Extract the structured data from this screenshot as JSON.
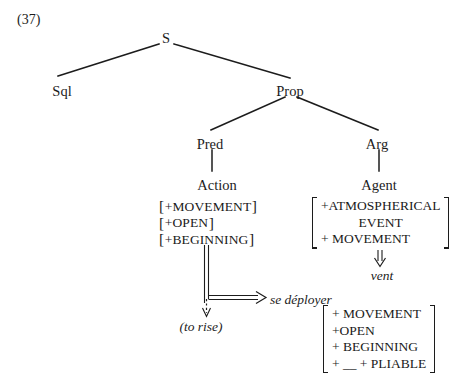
{
  "figure": {
    "example_number": "(37)",
    "background_color": "#ffffff",
    "ink_color": "#1c1c1c"
  },
  "tree": {
    "nodes": [
      {
        "id": "s",
        "label": "S"
      },
      {
        "id": "sql",
        "label": "Sql"
      },
      {
        "id": "prop",
        "label": "Prop"
      },
      {
        "id": "pred",
        "label": "Pred"
      },
      {
        "id": "arg",
        "label": "Arg"
      },
      {
        "id": "action",
        "label": "Action"
      },
      {
        "id": "agent",
        "label": "Agent"
      }
    ]
  },
  "matrices": {
    "action_features": {
      "bracket_style": "per-line",
      "open_bracket": "[",
      "close_bracket": "]",
      "rows": [
        {
          "text": "+MOVEMENT"
        },
        {
          "text": "+OPEN"
        },
        {
          "text": "+BEGINNING"
        }
      ]
    },
    "agent_features": {
      "bracket_style": "single-tall",
      "rows": [
        {
          "text": "+ATMOSPHERICAL",
          "align": "left"
        },
        {
          "text": "EVENT",
          "align": "center"
        },
        {
          "text": "+ MOVEMENT",
          "align": "left"
        }
      ]
    },
    "result_features": {
      "bracket_style": "single-tall",
      "rows": [
        {
          "text": "+ MOVEMENT",
          "align": "left"
        },
        {
          "text": "+OPEN",
          "align": "left"
        },
        {
          "text": "+ BEGINNING",
          "align": "left"
        },
        {
          "text": "+ __ + PLIABLE",
          "align": "left"
        }
      ]
    }
  },
  "realizations": {
    "agent_word": "vent",
    "verb_french": "se déployer",
    "verb_english_gloss": "(to rise)"
  }
}
